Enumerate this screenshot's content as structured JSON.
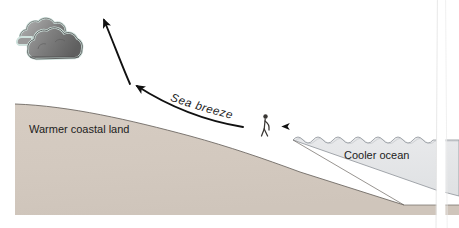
{
  "figure": {
    "type": "diagram",
    "width": 459,
    "height": 228,
    "background_color": "#ffffff"
  },
  "labels": {
    "land": "Warmer coastal land",
    "ocean": "Cooler ocean",
    "breeze": "Sea breeze"
  },
  "elements": {
    "cloud_name": "cumulus-cloud",
    "person_name": "person-figure",
    "land_name": "coastal-land-mass",
    "ocean_name": "ocean-water",
    "rising_arrow_name": "rising-air-arrow",
    "onshore_arrow_name": "onshore-breeze-arrow",
    "sea_arrow_name": "sea-surface-wind-arrow",
    "margin_band_name": "page-edge-band"
  },
  "colors": {
    "land_fill": "#d4cac0",
    "land_outline": "#6f6a64",
    "ocean_fill": "#e5e6e8",
    "ocean_outline": "#8d9298",
    "cloud_dark": "#6d6d6d",
    "cloud_mid": "#8a8a8a",
    "cloud_light": "#a9a9a9",
    "cloud_outline": "#d8e6e2",
    "arrow_black": "#111111",
    "arrow_tint": "#9a6f96",
    "text": "#1c1c1c"
  }
}
